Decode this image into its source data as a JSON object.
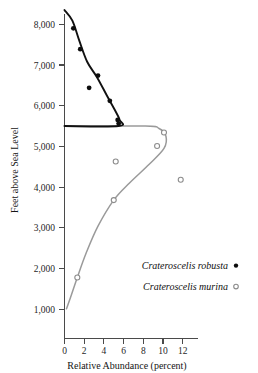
{
  "chart_data": {
    "type": "scatter",
    "title": "",
    "xlabel": "Relative Abundance (percent)",
    "ylabel": "Feet above Sea Level",
    "xlim": [
      0,
      13.5
    ],
    "ylim": [
      600,
      8400
    ],
    "xticks": [
      0,
      2,
      4,
      6,
      8,
      10,
      12
    ],
    "xtick_labels": [
      "0",
      "2",
      "4",
      "6",
      "8",
      "10",
      "12"
    ],
    "yticks": [
      1000,
      2000,
      3000,
      4000,
      5000,
      6000,
      7000,
      8000
    ],
    "ytick_labels": [
      "1,000",
      "2,000",
      "3,000",
      "4,000",
      "5,000",
      "6,000",
      "7,000",
      "8,000"
    ],
    "grid": false,
    "legend_position": "lower-right",
    "series": [
      {
        "name": "Crateroscelis robusta",
        "marker": "filled-circle",
        "color": "#0d0d0d",
        "points": [
          {
            "x": 0.9,
            "y": 7900
          },
          {
            "x": 1.6,
            "y": 7390
          },
          {
            "x": 3.4,
            "y": 6740
          },
          {
            "x": 2.5,
            "y": 6440
          },
          {
            "x": 4.6,
            "y": 6120
          },
          {
            "x": 5.4,
            "y": 5650
          },
          {
            "x": 5.5,
            "y": 5560
          }
        ],
        "curve": [
          {
            "x": 0.0,
            "y": 8350
          },
          {
            "x": 0.8,
            "y": 8090
          },
          {
            "x": 1.5,
            "y": 7600
          },
          {
            "x": 2.3,
            "y": 7080
          },
          {
            "x": 3.3,
            "y": 6700
          },
          {
            "x": 4.3,
            "y": 6250
          },
          {
            "x": 5.1,
            "y": 5900
          },
          {
            "x": 5.6,
            "y": 5650
          },
          {
            "x": 5.5,
            "y": 5500
          },
          {
            "x": 0.0,
            "y": 5500
          }
        ]
      },
      {
        "name": "Crateroscelis murina",
        "marker": "open-circle",
        "color": "#8c8c8c",
        "points": [
          {
            "x": 10.1,
            "y": 5340
          },
          {
            "x": 9.4,
            "y": 5010
          },
          {
            "x": 5.2,
            "y": 4630
          },
          {
            "x": 11.8,
            "y": 4180
          },
          {
            "x": 5.0,
            "y": 3680
          },
          {
            "x": 1.3,
            "y": 1780
          }
        ],
        "curve": [
          {
            "x": 0.0,
            "y": 5500
          },
          {
            "x": 8.2,
            "y": 5500
          },
          {
            "x": 9.6,
            "y": 5440
          },
          {
            "x": 10.3,
            "y": 5250
          },
          {
            "x": 10.1,
            "y": 4950
          },
          {
            "x": 8.6,
            "y": 4560
          },
          {
            "x": 6.6,
            "y": 4100
          },
          {
            "x": 5.0,
            "y": 3680
          },
          {
            "x": 3.4,
            "y": 3040
          },
          {
            "x": 2.2,
            "y": 2380
          },
          {
            "x": 1.3,
            "y": 1780
          },
          {
            "x": 0.6,
            "y": 1280
          },
          {
            "x": 0.2,
            "y": 1010
          }
        ]
      }
    ],
    "notes": {
      "boundary_elevation": 5500,
      "boundary_description": "Abrupt parapatric replacement: robusta occupies elevations above 5,500 ft, murina below"
    }
  },
  "legend": {
    "entries": [
      {
        "label": "Crateroscelis robusta",
        "marker": "filled-circle"
      },
      {
        "label": "Crateroscelis murina",
        "marker": "open-circle"
      }
    ]
  }
}
